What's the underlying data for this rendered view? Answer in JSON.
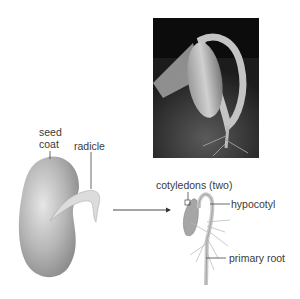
{
  "figure": {
    "photo": {
      "description": "germinating bean seedling photograph"
    },
    "labels": {
      "seed_coat_line1": "seed",
      "seed_coat_line2": "coat",
      "radicle": "radicle",
      "cotyledons": "cotyledons (two)",
      "hypocotyl": "hypocotyl",
      "primary_root": "primary root"
    },
    "colors": {
      "seed": "#b8b8b8",
      "photo_bg": "#111111",
      "line": "#444444"
    }
  }
}
